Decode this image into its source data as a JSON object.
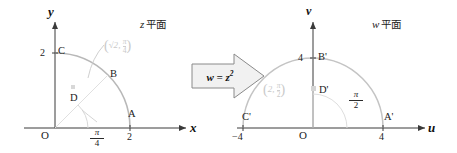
{
  "colors": {
    "axis": "#3a3a3a",
    "curve": "#b8b8b8",
    "faint": "#d2d2d2",
    "text": "#1b1b1b",
    "arrow_fill": "#f1f1f1",
    "arrow_stroke": "#8a8a8a",
    "background": "#ffffff"
  },
  "z_plane": {
    "title_var": "z",
    "title_cjk": "平面",
    "x_axis_label": "x",
    "y_axis_label": "y",
    "origin_label": "O",
    "x_tick": "2",
    "y_tick": "2",
    "angle_num": "π",
    "angle_den": "4",
    "points": [
      {
        "name": "A",
        "label": "A"
      },
      {
        "name": "B",
        "label": "B"
      },
      {
        "name": "C",
        "label": "C"
      },
      {
        "name": "D",
        "label": "D"
      }
    ],
    "polar_annotation": {
      "radius": "√2",
      "angle_num": "π",
      "angle_den": "4"
    }
  },
  "mapping": {
    "formula_lhs": "w",
    "formula_eq": "=",
    "formula_base": "z",
    "formula_exponent": "2"
  },
  "w_plane": {
    "title_var": "w",
    "title_cjk": "平面",
    "u_axis_label": "u",
    "v_axis_label": "v",
    "origin_label": "O",
    "u_tick_positive": "4",
    "u_tick_negative": "−4",
    "v_tick": "4",
    "angle_num": "π",
    "angle_den": "2",
    "points": [
      {
        "name": "A-prime",
        "label": "A'"
      },
      {
        "name": "B-prime",
        "label": "B'"
      },
      {
        "name": "C-prime",
        "label": "C'"
      },
      {
        "name": "D-prime",
        "label": "D'"
      }
    ],
    "polar_annotation": {
      "radius": "2",
      "angle_num": "π",
      "angle_den": "2"
    }
  }
}
